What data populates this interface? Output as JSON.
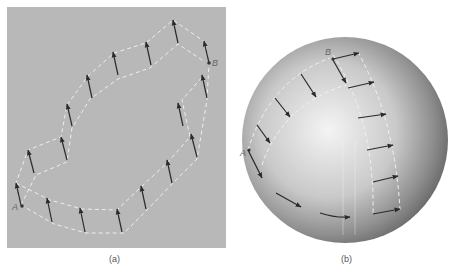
{
  "panels": [
    {
      "id": "a",
      "caption": "(a)",
      "description": "Parallel transport of a vector around a closed path in a flat plane",
      "point_labels": {
        "start": "A",
        "end": "B"
      },
      "background": "#b8b8b8"
    },
    {
      "id": "b",
      "caption": "(b)",
      "description": "Parallel transport of a vector along paths on a sphere",
      "point_labels": {
        "start": "A",
        "end": "B"
      },
      "background": "#ffffff"
    }
  ],
  "colors": {
    "panel_gray": "#b8b8b8",
    "dashed_path": "#eeeeee",
    "arrow": "#2a2a2a",
    "label": "#666666"
  }
}
